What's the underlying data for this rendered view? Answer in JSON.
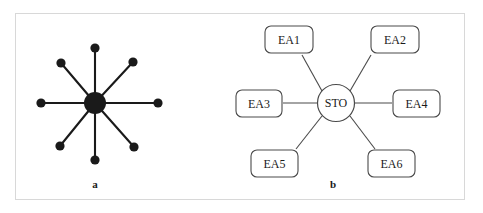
{
  "figure": {
    "border_color": "#d8d8d8",
    "background": "#ffffff",
    "ink_color": "#1a1a1a",
    "outline_color": "#4a4a4a"
  },
  "panels": [
    {
      "id": "a",
      "caption": "a",
      "type": "star-topology-schematic",
      "hub": {
        "cx": 95,
        "cy": 103,
        "r": 11,
        "fill": "#1a1a1a"
      },
      "spoke_count": 8,
      "spoke_length": 57,
      "node_radius": 4.5,
      "nodes": [
        {
          "name": "node-n",
          "cx": 95,
          "cy": 48
        },
        {
          "name": "node-ne",
          "cx": 133,
          "cy": 62
        },
        {
          "name": "node-e",
          "cx": 158,
          "cy": 103
        },
        {
          "name": "node-se",
          "cx": 134,
          "cy": 147
        },
        {
          "name": "node-s",
          "cx": 95,
          "cy": 160
        },
        {
          "name": "node-sw",
          "cx": 60,
          "cy": 146
        },
        {
          "name": "node-w",
          "cx": 41,
          "cy": 103
        },
        {
          "name": "node-nw",
          "cx": 61,
          "cy": 63
        }
      ]
    },
    {
      "id": "b",
      "caption": "b",
      "type": "hub-and-spoke-labeled",
      "hub": {
        "label": "STO",
        "cx": 336,
        "cy": 103,
        "r": 18.5
      },
      "nodes": [
        {
          "label": "EA1",
          "x": 265,
          "y": 26,
          "w": 48,
          "h": 27
        },
        {
          "label": "EA2",
          "x": 371,
          "y": 26,
          "w": 48,
          "h": 27
        },
        {
          "label": "EA3",
          "x": 236,
          "y": 90,
          "w": 46,
          "h": 27
        },
        {
          "label": "EA4",
          "x": 393,
          "y": 90,
          "w": 47,
          "h": 27
        },
        {
          "label": "EA5",
          "x": 251,
          "y": 150,
          "w": 47,
          "h": 27
        },
        {
          "label": "EA6",
          "x": 368,
          "y": 150,
          "w": 47,
          "h": 27
        }
      ],
      "edges": [
        {
          "from": "STO",
          "to": "EA1"
        },
        {
          "from": "STO",
          "to": "EA2"
        },
        {
          "from": "STO",
          "to": "EA3"
        },
        {
          "from": "STO",
          "to": "EA4"
        },
        {
          "from": "STO",
          "to": "EA5"
        },
        {
          "from": "STO",
          "to": "EA6"
        }
      ]
    }
  ]
}
